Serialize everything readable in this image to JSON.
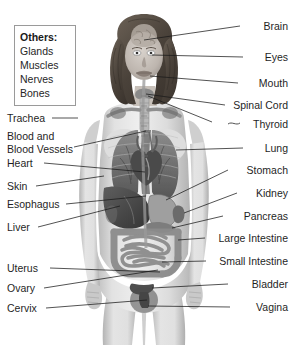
{
  "diagram": {
    "background_color": "#ffffff",
    "text_color": "#1f1f1f",
    "leader_line_color": "#1a1a1a"
  },
  "others_box": {
    "title": "Others:",
    "items": [
      {
        "label": "Glands"
      },
      {
        "label": "Muscles"
      },
      {
        "label": "Nerves"
      },
      {
        "label": "Bones"
      }
    ]
  },
  "left_labels": [
    {
      "label": "Trachea"
    },
    {
      "label": "Blood and"
    },
    {
      "label": "Blood Vessels"
    },
    {
      "label": "Heart"
    },
    {
      "label": "Skin"
    },
    {
      "label": "Esophagus"
    },
    {
      "label": "Liver"
    },
    {
      "label": "Uterus"
    },
    {
      "label": "Ovary"
    },
    {
      "label": "Cervix"
    }
  ],
  "right_labels": [
    {
      "label": "Brain"
    },
    {
      "label": "Eyes"
    },
    {
      "label": "Mouth"
    },
    {
      "label": "Spinal Cord"
    },
    {
      "label": "Thyroid"
    },
    {
      "label": "Lung"
    },
    {
      "label": "Stomach"
    },
    {
      "label": "Kidney"
    },
    {
      "label": "Pancreas"
    },
    {
      "label": "Large Intestine"
    },
    {
      "label": "Small Intestine"
    },
    {
      "label": "Bladder"
    },
    {
      "label": "Vagina"
    }
  ]
}
